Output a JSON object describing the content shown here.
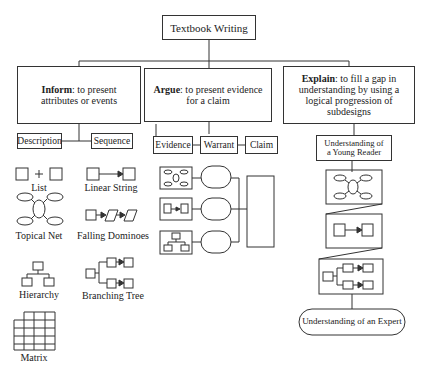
{
  "root": {
    "label": "Textbook Writing"
  },
  "categories": [
    {
      "name": "Inform",
      "desc": ": to present attributes or events"
    },
    {
      "name": "Argue",
      "desc": ": to present evidence for a claim"
    },
    {
      "name": "Explain",
      "desc": ": to fill a gap in understanding by using a logical progression of subdesigns"
    }
  ],
  "inform": {
    "subtypes": [
      "Description",
      "Sequence"
    ],
    "patterns": [
      "List",
      "Linear String",
      "Topical Net",
      "Falling Dominoes",
      "Hierarchy",
      "Branching Tree",
      "Matrix"
    ]
  },
  "argue": {
    "subtypes": [
      "Evidence",
      "Warrant",
      "Claim"
    ]
  },
  "explain": {
    "start": "Understanding of a Young Reader",
    "end": "Understanding of an Expert"
  }
}
